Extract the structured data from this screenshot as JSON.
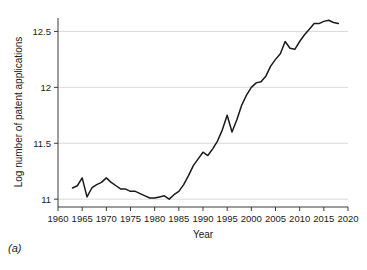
{
  "figure": {
    "caption": "(a)"
  },
  "chart_data": {
    "type": "line",
    "title": "",
    "xlabel": "Year",
    "ylabel": "Log number of patent applications",
    "xlim": [
      1960,
      2020
    ],
    "ylim": [
      10.93,
      12.62
    ],
    "grid": true,
    "grid_axis": "y",
    "legend": null,
    "line_color": "#1a1a1a",
    "xticks": [
      1960,
      1965,
      1970,
      1975,
      1980,
      1985,
      1990,
      1995,
      2000,
      2005,
      2010,
      2015,
      2020
    ],
    "xtick_labels": [
      "1960",
      "1965",
      "1970",
      "1975",
      "1980",
      "1985",
      "1990",
      "1995",
      "2000",
      "2005",
      "2010",
      "2015",
      "2020"
    ],
    "yticks": [
      11,
      11.5,
      12,
      12.5
    ],
    "ytick_labels": [
      "11",
      "11.5",
      "12",
      "12.5"
    ],
    "x": [
      1963,
      1964,
      1965,
      1966,
      1967,
      1968,
      1969,
      1970,
      1971,
      1972,
      1973,
      1974,
      1975,
      1976,
      1977,
      1978,
      1979,
      1980,
      1981,
      1982,
      1983,
      1984,
      1985,
      1986,
      1987,
      1988,
      1989,
      1990,
      1991,
      1992,
      1993,
      1994,
      1995,
      1996,
      1997,
      1998,
      1999,
      2000,
      2001,
      2002,
      2003,
      2004,
      2005,
      2006,
      2007,
      2008,
      2009,
      2010,
      2011,
      2012,
      2013,
      2014,
      2015,
      2016,
      2017,
      2018
    ],
    "values": [
      11.1,
      11.12,
      11.19,
      11.02,
      11.1,
      11.13,
      11.15,
      11.19,
      11.15,
      11.12,
      11.09,
      11.09,
      11.07,
      11.07,
      11.05,
      11.03,
      11.01,
      11.01,
      11.02,
      11.03,
      11.0,
      11.04,
      11.07,
      11.13,
      11.21,
      11.3,
      11.36,
      11.42,
      11.39,
      11.45,
      11.52,
      11.62,
      11.75,
      11.6,
      11.71,
      11.84,
      11.93,
      12.0,
      12.04,
      12.05,
      12.1,
      12.19,
      12.25,
      12.3,
      12.41,
      12.35,
      12.34,
      12.41,
      12.47,
      12.52,
      12.57,
      12.57,
      12.59,
      12.6,
      12.58,
      12.57
    ]
  }
}
